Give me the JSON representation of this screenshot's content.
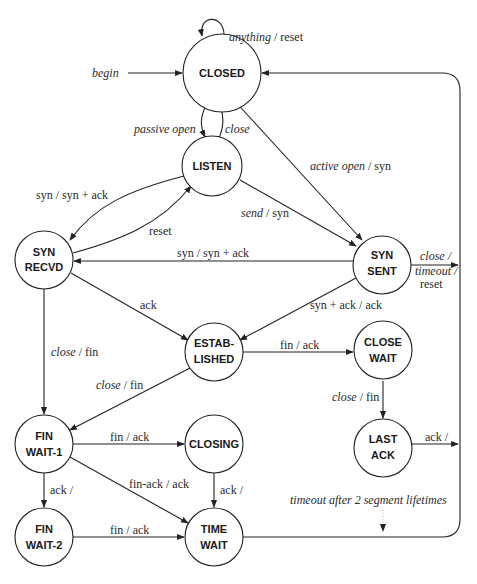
{
  "diagram": {
    "type": "state-machine",
    "states": [
      {
        "id": "closed",
        "lines": [
          "CLOSED"
        ]
      },
      {
        "id": "listen",
        "lines": [
          "LISTEN"
        ]
      },
      {
        "id": "syn_recvd",
        "lines": [
          "SYN",
          "RECVD"
        ]
      },
      {
        "id": "syn_sent",
        "lines": [
          "SYN",
          "SENT"
        ]
      },
      {
        "id": "established",
        "lines": [
          "ESTAB-",
          "LISHED"
        ]
      },
      {
        "id": "close_wait",
        "lines": [
          "CLOSE",
          "WAIT"
        ]
      },
      {
        "id": "fin_wait_1",
        "lines": [
          "FIN",
          "WAIT-1"
        ]
      },
      {
        "id": "closing",
        "lines": [
          "CLOSING"
        ]
      },
      {
        "id": "last_ack",
        "lines": [
          "LAST",
          "ACK"
        ]
      },
      {
        "id": "fin_wait_2",
        "lines": [
          "FIN",
          "WAIT-2"
        ]
      },
      {
        "id": "time_wait",
        "lines": [
          "TIME",
          "WAIT"
        ]
      }
    ],
    "transitions": [
      {
        "from": "closed",
        "to": "closed",
        "event": "anything",
        "action": "reset"
      },
      {
        "from": "start",
        "to": "closed",
        "event": "begin",
        "action": ""
      },
      {
        "from": "closed",
        "to": "listen",
        "event": "passive open",
        "action": ""
      },
      {
        "from": "listen",
        "to": "closed",
        "event": "close",
        "action": ""
      },
      {
        "from": "closed",
        "to": "syn_sent",
        "event": "active open",
        "action": "syn"
      },
      {
        "from": "listen",
        "to": "syn_recvd",
        "event": "syn",
        "action": "syn + ack"
      },
      {
        "from": "syn_recvd",
        "to": "listen",
        "event": "",
        "action": "reset"
      },
      {
        "from": "listen",
        "to": "syn_sent",
        "event": "send",
        "action": "syn"
      },
      {
        "from": "syn_sent",
        "to": "syn_recvd",
        "event": "syn",
        "action": "syn + ack"
      },
      {
        "from": "syn_sent",
        "to": "closed",
        "event": "close / timeout",
        "action": "reset"
      },
      {
        "from": "syn_recvd",
        "to": "established",
        "event": "ack",
        "action": ""
      },
      {
        "from": "syn_sent",
        "to": "established",
        "event": "syn + ack",
        "action": "ack"
      },
      {
        "from": "syn_recvd",
        "to": "fin_wait_1",
        "event": "close",
        "action": "fin"
      },
      {
        "from": "established",
        "to": "close_wait",
        "event": "fin",
        "action": "ack"
      },
      {
        "from": "established",
        "to": "fin_wait_1",
        "event": "close",
        "action": "fin"
      },
      {
        "from": "close_wait",
        "to": "last_ack",
        "event": "close",
        "action": "fin"
      },
      {
        "from": "fin_wait_1",
        "to": "closing",
        "event": "fin",
        "action": "ack"
      },
      {
        "from": "last_ack",
        "to": "closed",
        "event": "ack",
        "action": ""
      },
      {
        "from": "fin_wait_1",
        "to": "time_wait",
        "event": "fin-ack",
        "action": "ack"
      },
      {
        "from": "fin_wait_1",
        "to": "fin_wait_2",
        "event": "ack",
        "action": ""
      },
      {
        "from": "closing",
        "to": "time_wait",
        "event": "ack",
        "action": ""
      },
      {
        "from": "fin_wait_2",
        "to": "time_wait",
        "event": "fin",
        "action": "ack"
      },
      {
        "from": "time_wait",
        "to": "closed",
        "event": "timeout after 2 segment lifetimes",
        "action": ""
      }
    ]
  },
  "labels": {
    "anything": "anything",
    "reset": "reset",
    "begin": "begin",
    "passive_open": "passive open",
    "close": "close",
    "active_open": "active open",
    "syn": "syn",
    "syn_syn_ack_a": "syn / syn + ack",
    "send": "send",
    "syn_syn_ack_b": "syn / syn + ack",
    "close_slash": "close /",
    "timeout_slash": "timeout /",
    "ack": "ack",
    "syn_ack_ack": "syn + ack / ack",
    "fin": "fin",
    "fin_ack": "fin / ack",
    "ack_slash": "ack /",
    "fin_ack_ack": "fin-ack / ack",
    "timeout_2msl": "timeout after 2 segment lifetimes",
    "sep": " / "
  }
}
